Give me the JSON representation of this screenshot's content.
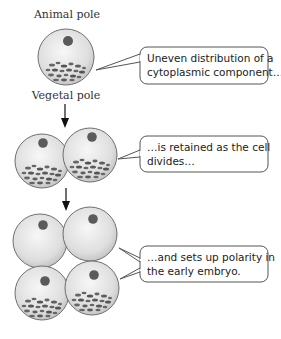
{
  "labels": {
    "animal_pole": "Animal pole",
    "vegetal_pole": "Vegetal pole"
  },
  "callouts": [
    {
      "line1": "Uneven distribution of a",
      "line2": "cytoplasmic component…"
    },
    {
      "line1": "…is retained as the cell",
      "line2": "divides…"
    },
    {
      "line1": "…and sets up polarity in",
      "line2": "the early embryo."
    }
  ],
  "stages": [
    {
      "name": "one-cell",
      "cells": 1
    },
    {
      "name": "two-cell",
      "cells": 2
    },
    {
      "name": "four-cell",
      "cells": 4
    }
  ],
  "colors": {
    "cell_fill": "#e4e4e4",
    "cell_stroke": "#6f6f6f",
    "nucleus": "#5a5a5a",
    "granule": "#666666",
    "callout_stroke": "#555555",
    "arrow": "#111111"
  }
}
